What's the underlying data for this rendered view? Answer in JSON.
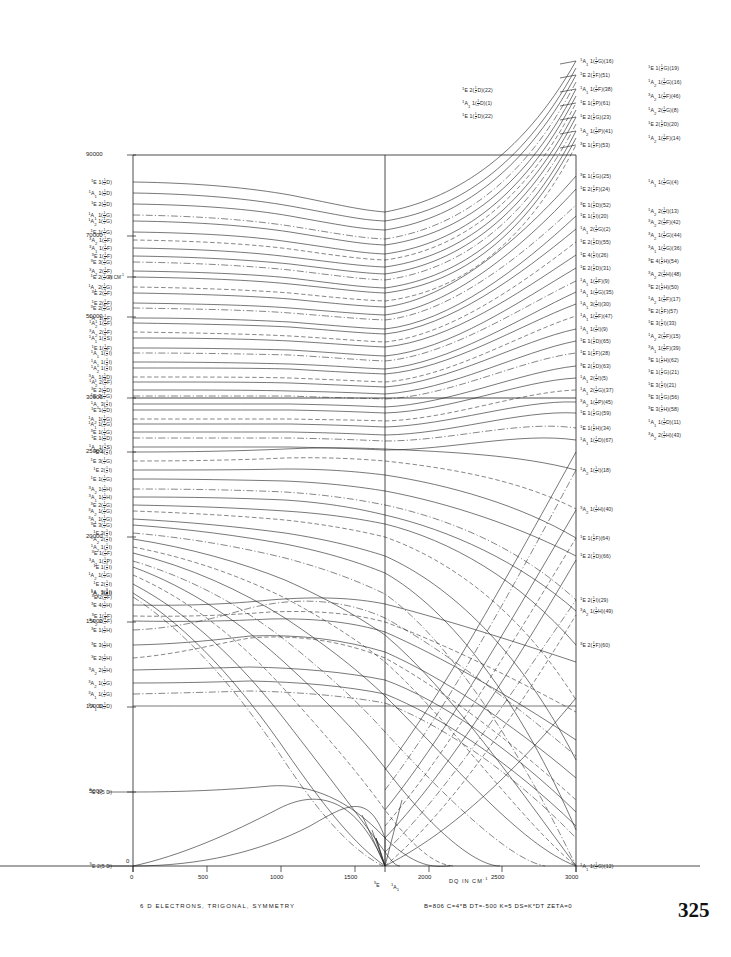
{
  "figure": {
    "caption": "6 D ELECTRONS, TRIGONAL, SYMMETRY",
    "parameters": "B=806  C=4*B  DT=-500  K=5  DS=K*DT  ZETA=0",
    "page_number": "325",
    "x_axis": {
      "title": "DQ IN CM-1",
      "min": 0,
      "max": 3000,
      "ticks": [
        "0",
        "500",
        "1000",
        "1500",
        "2000",
        "2500",
        "3000"
      ]
    },
    "y_axis": {
      "min": 0,
      "max": 90000,
      "ticks": [
        "5000",
        "10000",
        "15000",
        "20000",
        "25000",
        "30000",
        "50000",
        "70000",
        "90000"
      ],
      "unit_mark": "IN CM-1"
    },
    "ground_state_crossing": {
      "left_term": "5E",
      "right_term": "1A1",
      "dq": 1750
    }
  },
  "chart_data": {
    "type": "line",
    "title": "6 D ELECTRONS, TRIGONAL, SYMMETRY",
    "xlabel": "DQ IN CM-1",
    "ylabel": "ENERGY IN CM-1",
    "xlim": [
      0,
      3000
    ],
    "ylim": [
      0,
      92000
    ],
    "grid": false,
    "legend": "none",
    "axis_break": "Vertical scale is compressed above 30000 cm-1 (ticks 30000, 50000, 70000, 90000)."
  },
  "left_labels": [
    {
      "t": "1E  1(1/2 D)",
      "y": 182
    },
    {
      "t": "1A1 1(1/2 D)",
      "y": 193
    },
    {
      "t": "1E  2(1/2 D)",
      "y": 204
    },
    {
      "t": "1A1 1(1/2 G)",
      "y": 215
    },
    {
      "t": "1A2 1(1/2 G)",
      "y": 221
    },
    {
      "t": "1E  1(1/2 G)",
      "y": 232
    },
    {
      "t": "3A2 1(1/2 F)",
      "y": 240
    },
    {
      "t": "3A1 1(1/2 F)",
      "y": 248
    },
    {
      "t": "3E  1(1/2 F)",
      "y": 256
    },
    {
      "t": "3E  3(1/2 G)",
      "y": 262
    },
    {
      "t": "3A2 2(1/2 F)",
      "y": 271
    },
    {
      "t": "1E  2(1/2 G)",
      "y": 277
    },
    {
      "t": "1A1 2(1/2 G)",
      "y": 287
    },
    {
      "t": "3E  2(1/2 F)",
      "y": 293
    },
    {
      "t": "1E  2(1/2 F)",
      "y": 303
    },
    {
      "t": "3E  2(1/2 G)",
      "y": 308
    },
    {
      "t": "1A1 1(1/2 F)",
      "y": 318
    },
    {
      "t": "1A2 1(1/2 F)",
      "y": 323
    },
    {
      "t": "3A2 2(1/2 F)",
      "y": 332
    },
    {
      "t": "1A1 1(1/2 S)",
      "y": 338
    },
    {
      "t": "1E  1(1/2 F)",
      "y": 348
    },
    {
      "t": "1A1 1(1/2 I)",
      "y": 353
    },
    {
      "t": "1A1 1(1/2 I)",
      "y": 362
    },
    {
      "t": "1A2 1(1/2 I)",
      "y": 368
    },
    {
      "t": "3A1 1(1/2 D)",
      "y": 377
    },
    {
      "t": "1A2 2(1/2 F)",
      "y": 382
    },
    {
      "t": "3E  2(1/2 D)",
      "y": 390
    },
    {
      "t": "1E  3(1/2 G)",
      "y": 396
    },
    {
      "t": "1A1 3(1/2 I)",
      "y": 404
    },
    {
      "t": "1E  1(1/2 D)",
      "y": 410
    },
    {
      "t": "1A2 1(1/2 G)",
      "y": 419
    },
    {
      "t": "1A1 1(1/2 G)",
      "y": 424
    },
    {
      "t": "3E  1(1/2 G)",
      "y": 432
    },
    {
      "t": "1E  1(1/2 D)",
      "y": 438
    },
    {
      "t": "1A1 1(1/2 S)",
      "y": 447
    },
    {
      "t": "1E  4(1/2 I)",
      "y": 452
    },
    {
      "t": "1E  3(1/2 G)",
      "y": 461
    },
    {
      "t": "1E  2(1/2 I)",
      "y": 470
    },
    {
      "t": "1E  1(1/2 G)",
      "y": 479
    },
    {
      "t": "3A2 1(1/2 H)",
      "y": 489
    },
    {
      "t": "3A1 1(1/2 H)",
      "y": 497
    },
    {
      "t": "3E  2(1/2 G)",
      "y": 505
    },
    {
      "t": "3A2 1(1/2 G)",
      "y": 511
    },
    {
      "t": "3A1 1(1/2 G)",
      "y": 519
    },
    {
      "t": "3E  3(1/2 G)",
      "y": 525
    },
    {
      "t": "1E  3(1/2 I)",
      "y": 533
    },
    {
      "t": "1A2 2(1/2 I)",
      "y": 539
    },
    {
      "t": "1A2 1(1/2 I)",
      "y": 547
    },
    {
      "t": "3E  1(1/2 F)",
      "y": 553
    },
    {
      "t": "3A2 1(1/2 P)",
      "y": 561
    },
    {
      "t": "1E  1(1/2 I)",
      "y": 567
    },
    {
      "t": "1A2 1(1/2 G)",
      "y": 575
    },
    {
      "t": "1E  2(1/2 I)",
      "y": 584
    },
    {
      "t": "1A1 3(1/2 I)",
      "y": 593
    },
    {
      "t": "3E  2(1/2 F)",
      "y": 597
    },
    {
      "t": "1A2 3(1/2 I)",
      "y": 592
    },
    {
      "t": "3E  4(1/2 H)",
      "y": 605
    },
    {
      "t": "3E  1(1/2 F)",
      "y": 616
    },
    {
      "t": "3A2 2(1/2 F)",
      "y": 621
    },
    {
      "t": "3E  1(1/2 H)",
      "y": 630
    },
    {
      "t": "3E  3(1/2 H)",
      "y": 645
    },
    {
      "t": "3E  2(1/2 H)",
      "y": 658
    },
    {
      "t": "3A2 2(1/2 H)",
      "y": 670
    },
    {
      "t": "3A2 1(1/2 G)",
      "y": 683
    },
    {
      "t": "3A1 1(1/2 G)",
      "y": 694
    },
    {
      "t": "5A1 1(1/2 D)",
      "y": 706
    },
    {
      "t": "5E  1(5 D)",
      "y": 792
    },
    {
      "t": "5E  2(5 D)",
      "y": 866
    }
  ],
  "right_labels_inner": [
    {
      "t": "1A1 1(1/2 G)(16)",
      "y": 61
    },
    {
      "t": "1E  2(1/2 F)(51)",
      "y": 75
    },
    {
      "t": "1A1 1(1/2 F)(38)",
      "y": 89
    },
    {
      "t": "1E  1(1/2 P)(61)",
      "y": 103
    },
    {
      "t": "1E  2(1/2 G)(23)",
      "y": 117
    },
    {
      "t": "1A2 1(1/2 P)(41)",
      "y": 131
    },
    {
      "t": "3E  1(1/2 F)(53)",
      "y": 145
    },
    {
      "t": "3E  1(1/2 G)(25)",
      "y": 176
    },
    {
      "t": "1E  2(1/2 F)(24)",
      "y": 189
    },
    {
      "t": "3E  1(1/2 D)(52)",
      "y": 205
    },
    {
      "t": "1E  1(1/2 I)(20)",
      "y": 216
    },
    {
      "t": "1A1 2(1/2 G)(2)",
      "y": 229
    },
    {
      "t": "1E  2(1/2 D)(55)",
      "y": 242
    },
    {
      "t": "1E  4(1/2 I)(26)",
      "y": 255
    },
    {
      "t": "1E  2(1/2 D)(31)",
      "y": 268
    },
    {
      "t": "1A1 1(1/2 F)(9)",
      "y": 281
    },
    {
      "t": "1A1 1(1/2 G)(35)",
      "y": 292
    },
    {
      "t": "1A1 3(1/2 I)(30)",
      "y": 304
    },
    {
      "t": "1A1 1(1/2 F)(47)",
      "y": 316
    },
    {
      "t": "1A1 1(1/2 I)(9)",
      "y": 329
    },
    {
      "t": "1E  1(1/2 D)(65)",
      "y": 341
    },
    {
      "t": "1E  1(1/2 F)(28)",
      "y": 353
    },
    {
      "t": "3E  2(1/2 D)(63)",
      "y": 366
    },
    {
      "t": "1A1 2(1/2 I)(5)",
      "y": 378
    },
    {
      "t": "1A1 2(1/2 G)(37)",
      "y": 390
    },
    {
      "t": "3A2 1(1/2 P)(45)",
      "y": 402
    },
    {
      "t": "1E  1(1/2 G)(59)",
      "y": 413
    },
    {
      "t": "1E  1(1/2 H)(34)",
      "y": 428
    },
    {
      "t": "1A1 1(1/2 D)(67)",
      "y": 440
    }
  ],
  "right_labels_outer": [
    {
      "t": "1E  1(1/2 G)(19)",
      "y": 68
    },
    {
      "t": "1A2 1(1/2 G)(16)",
      "y": 82
    },
    {
      "t": "3A2 1(1/2 F)(46)",
      "y": 96
    },
    {
      "t": "1A2 2(1/2 G)(8)",
      "y": 110
    },
    {
      "t": "1E  2(1/2 D)(20)",
      "y": 124
    },
    {
      "t": "1A2 1(1/2 F)(14)",
      "y": 138
    },
    {
      "t": "1A1 1(1/2 G)(4)",
      "y": 182
    },
    {
      "t": "1A2 2(1/2 I)(13)",
      "y": 211
    },
    {
      "t": "3A2 2(1/2 F)(42)",
      "y": 222
    },
    {
      "t": "3A2 1(1/2 G)(44)",
      "y": 235
    },
    {
      "t": "3A1 1(1/2 G)(36)",
      "y": 248
    },
    {
      "t": "3E  4(1/2 H)(54)",
      "y": 261
    },
    {
      "t": "3A2 2(1/2 H)(48)",
      "y": 274
    },
    {
      "t": "3E  2(1/2 H)(50)",
      "y": 287
    },
    {
      "t": "1A2 1(1/2 F)(17)",
      "y": 299
    },
    {
      "t": "3E  2(1/2 F)(57)",
      "y": 311
    },
    {
      "t": "1E  3(1/2 I)(33)",
      "y": 323
    },
    {
      "t": "1A2 2(1/2 F)(15)",
      "y": 336
    },
    {
      "t": "3A1 1(1/2 F)(39)",
      "y": 348
    },
    {
      "t": "3E  1(1/2 H)(62)",
      "y": 360
    },
    {
      "t": "1E  1(1/2 G)(21)",
      "y": 372
    },
    {
      "t": "1E  3(1/2 I)(21)",
      "y": 385
    },
    {
      "t": "3E  3(1/2 G)(56)",
      "y": 397
    },
    {
      "t": "3E  3(1/2 H)(58)",
      "y": 409
    },
    {
      "t": "1A1 1(1/2 D)(11)",
      "y": 422
    },
    {
      "t": "3A2 2(1/2 H)(43)",
      "y": 435
    }
  ],
  "right_labels_low": [
    {
      "t": "1A2 1(1/2 I)(18)",
      "y": 470
    },
    {
      "t": "3A2 1(1/2 H)(40)",
      "y": 509
    },
    {
      "t": "1E  1(1/2 F)(64)",
      "y": 538
    },
    {
      "t": "1E  2(1/2 D)(66)",
      "y": 556
    },
    {
      "t": "1E  2(1/2 I)(29)",
      "y": 600
    },
    {
      "t": "3A2 1(1/2 H)(49)",
      "y": 611
    },
    {
      "t": "3E  2(1/2 F)(60)",
      "y": 645
    },
    {
      "t": "1A1 1(1/2 G)(12)",
      "y": 866
    }
  ],
  "top_center_labels": [
    {
      "t": "1E  2(1/2 D)(22)",
      "y": 90
    },
    {
      "t": "1A1 1(1/2 D)(1)",
      "y": 103
    },
    {
      "t": "1E  1(1/2 D)(22)",
      "y": 116
    }
  ]
}
